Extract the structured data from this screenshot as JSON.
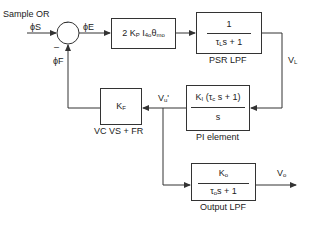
{
  "inputs": {
    "sample_label": "Sample OR",
    "phi_s": "ϕS",
    "phi_e": "ϕE",
    "phi_f": "ϕF",
    "minus_sign": "–"
  },
  "blocks": {
    "gain": {
      "expression": "2 Kp I4o θmo"
    },
    "psr_lpf": {
      "numerator": "1",
      "denominator": "τL s + 1",
      "caption": "PSR LPF"
    },
    "pi_element": {
      "numerator": "KI (τc s + 1)",
      "denominator": "s",
      "caption": "PI element"
    },
    "feedback": {
      "expression": "KF",
      "caption": "VC VS + FR"
    },
    "output_lpf": {
      "numerator": "Ko",
      "denominator": "τo s + 1",
      "caption": "Output LPF"
    }
  },
  "signals": {
    "v_l": "VL",
    "v_u_prime": "Vu'",
    "v_o": "Vo"
  },
  "colors": {
    "line": "#333333",
    "background": "#ffffff"
  }
}
